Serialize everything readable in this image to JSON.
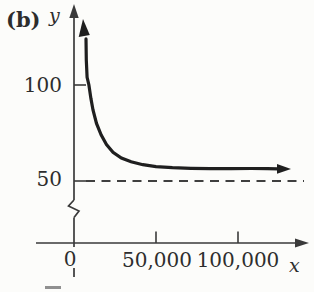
{
  "chart_data": {
    "type": "line",
    "panel_label": "(b)",
    "title": "",
    "xlabel": "x",
    "ylabel": "y",
    "x_ticks": [
      {
        "value": 0,
        "label": "0"
      },
      {
        "value": 50000,
        "label": "50,000"
      },
      {
        "value": 100000,
        "label": "100,000"
      }
    ],
    "y_ticks": [
      {
        "value": 50,
        "label": "50"
      },
      {
        "value": 100,
        "label": "100"
      }
    ],
    "asymptote": {
      "y": 50,
      "style": "dashed"
    },
    "y_axis_break": true,
    "xlim": [
      0,
      135000
    ],
    "ylim_shown": [
      50,
      135
    ],
    "grid": false,
    "legend": false,
    "series": [
      {
        "name": "decreasing-curve",
        "arrow_start": "up",
        "arrow_end": "right",
        "points": [
          [
            7300,
            124
          ],
          [
            7500,
            113
          ],
          [
            8000,
            104
          ],
          [
            9100,
            100
          ],
          [
            10300,
            93
          ],
          [
            11600,
            87
          ],
          [
            13700,
            80
          ],
          [
            16500,
            74
          ],
          [
            19800,
            69
          ],
          [
            23800,
            65
          ],
          [
            28900,
            62
          ],
          [
            34800,
            60
          ],
          [
            42000,
            58.5
          ],
          [
            50000,
            57.5
          ],
          [
            60000,
            57
          ],
          [
            71300,
            56.6
          ],
          [
            83000,
            56.4
          ],
          [
            95700,
            56.4
          ],
          [
            108000,
            56.5
          ],
          [
            118000,
            56.4
          ],
          [
            124400,
            56.3
          ]
        ]
      }
    ]
  },
  "colors": {
    "ink": "#2d2d2d",
    "axis": "#3a3a3a",
    "curve": "#1f1f1f",
    "dashed": "#3f3f3f",
    "background": "#fcfcfa"
  }
}
